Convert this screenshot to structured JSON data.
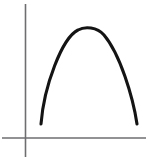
{
  "figure": {
    "title": "Downward-opening parabola on coordinate axes",
    "width": 148,
    "height": 168,
    "background_color": "#ffffff"
  },
  "axes": {
    "color": "#6e6e70",
    "stroke_width": 1.6,
    "origin": {
      "x": 25.5,
      "y": 138
    },
    "vertical": {
      "name": "y-axis",
      "x": 25.5,
      "y_top": 4,
      "y_bottom": 157
    },
    "horizontal": {
      "name": "x-axis",
      "y": 138,
      "x_left": 2,
      "x_right": 146
    }
  },
  "curve": {
    "name": "parabola",
    "color": "#141414",
    "stroke_width": 3.1,
    "left_endpoint": {
      "x": 41,
      "y": 124
    },
    "vertex": {
      "x": 91,
      "y": 27
    },
    "right_endpoint": {
      "x": 137,
      "y": 124
    },
    "path": "M 41 124 C 44 86, 62 38, 78 30 C 85 26, 97 27, 104 35 C 120 54, 133 97, 137 124"
  },
  "chart_data": {
    "type": "line",
    "title": "Downward-opening parabola on coordinate axes",
    "xlabel": "",
    "ylabel": "",
    "grid": false,
    "legend": "none",
    "annotations": [],
    "axis_ticks": {
      "x": [],
      "y": []
    },
    "xlim": [
      -0.6,
      3.2
    ],
    "ylim": [
      -0.5,
      5.0
    ],
    "series": [
      {
        "name": "parabola",
        "color": "#141414",
        "x": [
          0.4,
          0.6,
          0.8,
          1.0,
          1.2,
          1.4,
          1.55,
          1.7,
          1.85,
          2.0,
          2.2,
          2.4,
          2.6,
          2.8,
          2.95
        ],
        "y": [
          0.48,
          1.4,
          2.22,
          2.92,
          3.5,
          3.92,
          4.12,
          4.22,
          4.2,
          4.08,
          3.72,
          3.18,
          2.48,
          1.58,
          0.82
        ]
      }
    ]
  }
}
